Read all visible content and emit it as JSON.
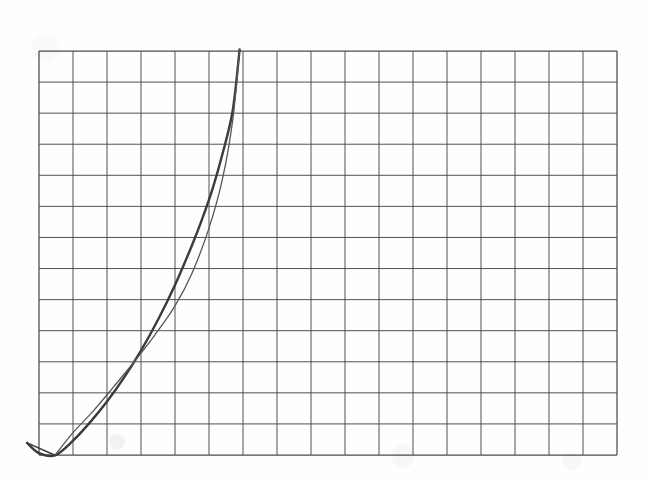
{
  "figure": {
    "title": "",
    "background_color": "#fefefe",
    "grid_color": "#4a4a4a",
    "curve_color": "#3a3a3a",
    "secondary_curve_color": "#565656"
  },
  "chart_data": {
    "type": "line",
    "title": "",
    "subtitle": "",
    "xlabel": "",
    "ylabel": "",
    "legend": [],
    "annotations": [],
    "grid": {
      "visible": true,
      "columns": 17,
      "rows": 13,
      "cell_width_px": 34,
      "cell_height_px": 31,
      "left_px": 39,
      "top_px": 51,
      "right_px": 617,
      "bottom_px": 455,
      "color": "#4a4a4a",
      "line_width_px": 1
    },
    "axis": {
      "xlim": [
        0,
        17
      ],
      "ylim": [
        0,
        13
      ],
      "x_tick_labels": [],
      "y_tick_labels": [],
      "ticks_visible": false
    },
    "series": [
      {
        "name": "measured-curve",
        "style": "solid",
        "width_px": 2.4,
        "color": "#3a3a3a",
        "x": [
          -0.35,
          0.0,
          0.47,
          1.0,
          1.5,
          2.0,
          2.5,
          3.0,
          3.5,
          4.0,
          4.5,
          4.8,
          5.1,
          5.4,
          5.7,
          5.9
        ],
        "y": [
          0.39,
          0.06,
          -0.01,
          0.46,
          1.05,
          1.72,
          2.49,
          3.36,
          4.35,
          5.47,
          6.75,
          7.6,
          8.55,
          9.7,
          11.1,
          13.05
        ]
      },
      {
        "name": "fitted-line",
        "style": "solid",
        "width_px": 1.3,
        "color": "#565656",
        "x": [
          0.47,
          1.0,
          1.6,
          2.2,
          2.8,
          3.4,
          4.0,
          4.5,
          5.0,
          5.4,
          5.7,
          5.9
        ],
        "y": [
          -0.01,
          0.72,
          1.42,
          2.2,
          3.0,
          3.85,
          4.8,
          5.85,
          7.3,
          8.9,
          10.8,
          13.05
        ]
      }
    ],
    "markers": [
      {
        "name": "origin-tick",
        "description": "short stroke from upper-left down to curve minimum",
        "from": [
          -0.35,
          0.39
        ],
        "to": [
          0.47,
          -0.01
        ]
      }
    ],
    "crossing_point": [
      3.65,
      4.65
    ],
    "apex_point": [
      5.9,
      13.05
    ]
  }
}
